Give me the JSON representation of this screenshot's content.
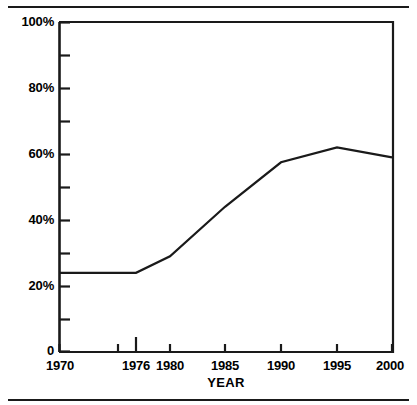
{
  "chart_data": {
    "type": "line",
    "title": "",
    "xlabel": "YEAR",
    "ylabel": "",
    "x": [
      1970,
      1976,
      1980,
      1985,
      1990,
      1995,
      2000
    ],
    "values": [
      24,
      24,
      29,
      44,
      57.5,
      62,
      59
    ],
    "series": [
      {
        "name": "",
        "values": [
          24,
          24,
          29,
          44,
          57.5,
          62,
          59
        ]
      }
    ],
    "categories": [
      "1970",
      "1976",
      "1980",
      "1985",
      "1990",
      "1995",
      "2000"
    ],
    "xlim": [
      1970,
      2000
    ],
    "ylim": [
      0,
      100
    ],
    "y_tick_labels": [
      "100%",
      "80%",
      "60%",
      "40%",
      "20%",
      "0"
    ],
    "y_major_ticks": [
      100,
      80,
      60,
      40,
      20,
      0
    ],
    "y_minor_ticks": [
      90,
      70,
      50,
      30,
      10
    ],
    "x_tick_labels": [
      "1970",
      "1976",
      "1980",
      "1985",
      "1990",
      "1995",
      "2000"
    ],
    "grid": false,
    "legend": "none",
    "line_color": "#1a1a1a",
    "axis_color": "#1a1a1a",
    "background_color": "#ffffff"
  },
  "axes": {
    "y_ticks": [
      {
        "label": "100%",
        "value": 100
      },
      {
        "label": "80%",
        "value": 80
      },
      {
        "label": "60%",
        "value": 60
      },
      {
        "label": "40%",
        "value": 40
      },
      {
        "label": "20%",
        "value": 20
      },
      {
        "label": "0",
        "value": 0
      }
    ],
    "x_ticks": [
      {
        "label": "1970",
        "value": 1970
      },
      {
        "label": "1976",
        "value": 1976
      },
      {
        "label": "1980",
        "value": 1980
      },
      {
        "label": "1985",
        "value": 1985
      },
      {
        "label": "1990",
        "value": 1990
      },
      {
        "label": "1995",
        "value": 1995
      },
      {
        "label": "2000",
        "value": 2000
      }
    ],
    "x_axis_title": "YEAR"
  }
}
